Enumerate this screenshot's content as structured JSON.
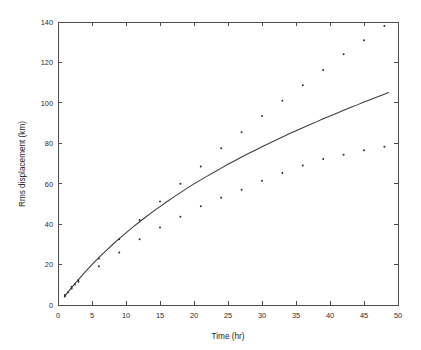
{
  "chart_data": {
    "type": "scatter",
    "title": "",
    "xlabel": "Time (hr)",
    "ylabel": "Rms displacement (km)",
    "xlim": [
      0,
      50
    ],
    "ylim": [
      0,
      140
    ],
    "xticks": [
      0,
      5,
      10,
      15,
      20,
      25,
      30,
      35,
      40,
      45,
      50
    ],
    "yticks": [
      0,
      20,
      40,
      60,
      80,
      100,
      120,
      140
    ],
    "grid": false,
    "legend": null,
    "marker": "dot",
    "marker_color": "#2e2e38",
    "line_color": "#3a3a46",
    "background_color": "#ffffff",
    "axis_color": "#4d4d4d",
    "series": [
      {
        "name": "Observed rms displacement",
        "type": "scatter",
        "points": [
          [
            1,
            4.2
          ],
          [
            1,
            5.0
          ],
          [
            1.5,
            6.3
          ],
          [
            2,
            8.2
          ],
          [
            2,
            9.0
          ],
          [
            2.5,
            10.2
          ],
          [
            3,
            11.5
          ],
          [
            3,
            12.3
          ],
          [
            6,
            23.0
          ],
          [
            6,
            19.2
          ],
          [
            9,
            32.5
          ],
          [
            9,
            26.0
          ],
          [
            12,
            42.0
          ],
          [
            12,
            32.5
          ],
          [
            15,
            51.2
          ],
          [
            15,
            38.3
          ],
          [
            18,
            60.0
          ],
          [
            18,
            43.6
          ],
          [
            21,
            68.5
          ],
          [
            21,
            48.8
          ],
          [
            24,
            77.5
          ],
          [
            24,
            53.0
          ],
          [
            27,
            85.5
          ],
          [
            27,
            57.0
          ],
          [
            30,
            93.5
          ],
          [
            30,
            61.5
          ],
          [
            33,
            101.0
          ],
          [
            33,
            65.3
          ],
          [
            36,
            108.7
          ],
          [
            36,
            69.0
          ],
          [
            39,
            116.2
          ],
          [
            39,
            72.2
          ],
          [
            42,
            124.0
          ],
          [
            42,
            74.3
          ],
          [
            45,
            131.0
          ],
          [
            45,
            76.5
          ],
          [
            48,
            138.0
          ],
          [
            48,
            78.3
          ]
        ]
      },
      {
        "name": "Fitted curve",
        "type": "line",
        "points": [
          [
            1.0,
            4.4
          ],
          [
            2.0,
            8.6
          ],
          [
            3.0,
            12.6
          ],
          [
            4.0,
            16.4
          ],
          [
            5.0,
            20.0
          ],
          [
            6.0,
            23.4
          ],
          [
            7.0,
            26.7
          ],
          [
            8.0,
            29.8
          ],
          [
            9.0,
            32.8
          ],
          [
            10.0,
            35.7
          ],
          [
            11.0,
            38.5
          ],
          [
            12.0,
            41.2
          ],
          [
            13.0,
            43.8
          ],
          [
            14.0,
            46.3
          ],
          [
            15.0,
            48.7
          ],
          [
            16.0,
            51.1
          ],
          [
            17.0,
            53.4
          ],
          [
            18.0,
            55.6
          ],
          [
            19.0,
            57.8
          ],
          [
            20.0,
            59.9
          ],
          [
            21.0,
            61.9
          ],
          [
            22.0,
            63.9
          ],
          [
            23.0,
            65.8
          ],
          [
            24.0,
            67.7
          ],
          [
            25.0,
            69.6
          ],
          [
            26.0,
            71.4
          ],
          [
            27.0,
            73.2
          ],
          [
            28.0,
            74.9
          ],
          [
            29.0,
            76.6
          ],
          [
            30.0,
            78.3
          ],
          [
            31.0,
            79.9
          ],
          [
            32.0,
            81.5
          ],
          [
            33.0,
            83.1
          ],
          [
            34.0,
            84.7
          ],
          [
            35.0,
            86.2
          ],
          [
            36.0,
            87.7
          ],
          [
            37.0,
            89.2
          ],
          [
            38.0,
            90.6
          ],
          [
            39.0,
            92.1
          ],
          [
            40.0,
            93.5
          ],
          [
            41.0,
            94.9
          ],
          [
            42.0,
            96.3
          ],
          [
            43.0,
            97.7
          ],
          [
            44.0,
            99.0
          ],
          [
            45.0,
            100.4
          ],
          [
            46.0,
            101.7
          ],
          [
            47.0,
            103.0
          ],
          [
            48.0,
            104.3
          ],
          [
            48.6,
            105.1
          ]
        ]
      }
    ]
  }
}
